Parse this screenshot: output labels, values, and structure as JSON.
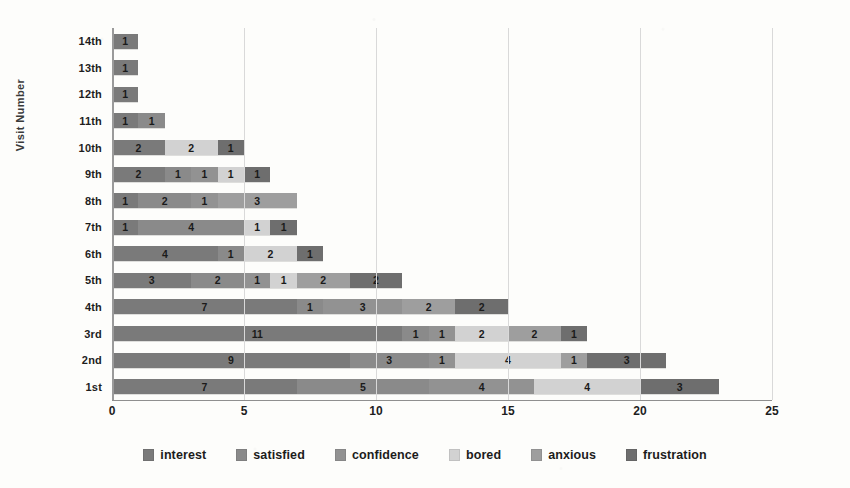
{
  "chart_data": {
    "type": "bar",
    "orientation": "horizontal",
    "stacked": true,
    "title": "",
    "xlabel": "",
    "ylabel": "Visit  Number",
    "xlim": [
      0,
      25
    ],
    "xticks": [
      0,
      5,
      10,
      15,
      20,
      25
    ],
    "grid": true,
    "legend_position": "bottom",
    "categories": [
      "1st",
      "2nd",
      "3rd",
      "4th",
      "5th",
      "6th",
      "7th",
      "8th",
      "9th",
      "10th",
      "11th",
      "12th",
      "13th",
      "14th"
    ],
    "series": [
      {
        "name": "interest",
        "color": "#7a7a7a",
        "values": [
          7,
          9,
          11,
          7,
          3,
          4,
          1,
          1,
          2,
          2,
          1,
          1,
          1,
          1
        ]
      },
      {
        "name": "satisfied",
        "color": "#8a8a8a",
        "values": [
          5,
          3,
          1,
          1,
          2,
          1,
          4,
          2,
          1,
          0,
          1,
          0,
          0,
          0
        ]
      },
      {
        "name": "confidence",
        "color": "#929292",
        "values": [
          4,
          1,
          1,
          3,
          1,
          0,
          0,
          1,
          1,
          0,
          0,
          0,
          0,
          0
        ]
      },
      {
        "name": "bored",
        "color": "#d2d2d2",
        "values": [
          4,
          4,
          2,
          0,
          1,
          2,
          1,
          0,
          1,
          2,
          0,
          0,
          0,
          0
        ]
      },
      {
        "name": "anxious",
        "color": "#9e9e9e",
        "values": [
          0,
          1,
          2,
          2,
          2,
          0,
          0,
          3,
          0,
          0,
          0,
          0,
          0,
          0
        ]
      },
      {
        "name": "frustration",
        "color": "#6e6e6e",
        "values": [
          3,
          3,
          1,
          2,
          2,
          1,
          1,
          0,
          1,
          1,
          0,
          0,
          0,
          0
        ]
      }
    ],
    "row_totals": [
      23,
      21,
      18,
      15,
      11,
      8,
      7,
      7,
      6,
      5,
      2,
      1,
      1,
      1
    ]
  },
  "legend": {
    "items": [
      {
        "label": "interest",
        "color": "#7a7a7a"
      },
      {
        "label": "satisfied",
        "color": "#8a8a8a"
      },
      {
        "label": "confidence",
        "color": "#929292"
      },
      {
        "label": "bored",
        "color": "#d2d2d2"
      },
      {
        "label": "anxious",
        "color": "#9e9e9e"
      },
      {
        "label": "frustration",
        "color": "#6e6e6e"
      }
    ]
  },
  "axis": {
    "y_title": "Visit  Number",
    "x_tick_labels": [
      "0",
      "5",
      "10",
      "15",
      "20",
      "25"
    ],
    "y_tick_labels": [
      "14th",
      "13th",
      "12th",
      "11th",
      "10th",
      "9th",
      "8th",
      "7th",
      "6th",
      "5th",
      "4th",
      "3rd",
      "2nd",
      "1st"
    ]
  }
}
